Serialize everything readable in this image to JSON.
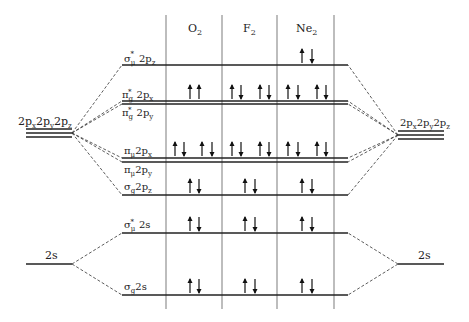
{
  "columns": [
    {
      "label": "O",
      "sub": "2"
    },
    {
      "label": "F",
      "sub": "2"
    },
    {
      "label": "Ne",
      "sub": "2"
    }
  ],
  "atomic_orbitals": {
    "left_2p": "2pₓ2pᵧ2p_z",
    "right_2p": "2pₓ2pᵧ2p_z",
    "left_2s": "2s",
    "right_2s": "2s"
  },
  "molecular_orbitals": [
    {
      "id": "sigma_u_star_2pz",
      "label": "σ*u 2pz",
      "y": 65,
      "electrons": {
        "O2": 0,
        "F2": 0,
        "Ne2": 2
      }
    },
    {
      "id": "pi_g_star_2px",
      "label": "π*g 2px",
      "y": 101,
      "electrons": {
        "O2": 1,
        "F2": 2,
        "Ne2": 2
      }
    },
    {
      "id": "pi_g_star_2py",
      "label": "π*g 2py",
      "y": 104,
      "electrons": {
        "O2": 1,
        "F2": 2,
        "Ne2": 2
      }
    },
    {
      "id": "pi_u_2px",
      "label": "πu 2px",
      "y": 158,
      "electrons": {
        "O2": 2,
        "F2": 2,
        "Ne2": 2
      }
    },
    {
      "id": "pi_u_2py",
      "label": "πu 2py",
      "y": 162,
      "electrons": {
        "O2": 2,
        "F2": 2,
        "Ne2": 2
      }
    },
    {
      "id": "sigma_g_2pz",
      "label": "σg 2pz",
      "y": 195,
      "electrons": {
        "O2": 2,
        "F2": 2,
        "Ne2": 2
      }
    },
    {
      "id": "sigma_u_star_2s",
      "label": "σ*u 2s",
      "y": 233,
      "electrons": {
        "O2": 2,
        "F2": 2,
        "Ne2": 2
      }
    },
    {
      "id": "sigma_g_2s",
      "label": "σg 2s",
      "y": 295,
      "electrons": {
        "O2": 2,
        "F2": 2,
        "Ne2": 2
      }
    }
  ],
  "colors": {
    "line": "#222222",
    "divider": "#999999",
    "arrow": "#111111"
  }
}
